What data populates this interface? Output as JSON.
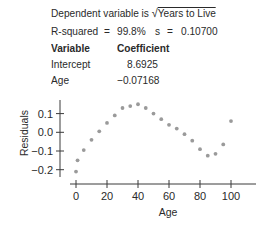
{
  "summary": {
    "dependent_prefix": "Dependent variable is",
    "dependent_radical": "√",
    "dependent_var": "Years to Live",
    "r_squared_label": "R-squared",
    "eq1": "=",
    "r_squared_value": "99.8%",
    "s_label": "s",
    "eq2": "=",
    "s_value": "0.10700"
  },
  "coef_table": {
    "headers": [
      "Variable",
      "Coefficient"
    ],
    "rows": [
      {
        "variable": "Intercept",
        "coefficient": "8.6925"
      },
      {
        "variable": "Age",
        "coefficient": "−0.07168"
      }
    ]
  },
  "chart_data": {
    "type": "scatter",
    "title": "",
    "xlabel": "Age",
    "ylabel": "Residuals",
    "xlim": [
      -3,
      118
    ],
    "ylim": [
      -0.26,
      0.18
    ],
    "xticks": [
      0,
      20,
      40,
      60,
      80,
      100
    ],
    "xtick_labels": [
      "0",
      "20",
      "40",
      "60",
      "80",
      "100"
    ],
    "yticks": [
      0.1,
      0.0,
      -0.1,
      -0.2
    ],
    "ytick_labels": [
      "0.1",
      "0.0",
      "−0.1",
      "−0.2"
    ],
    "grid": false,
    "legend": null,
    "point_color": "#9a9a9a",
    "series": [
      {
        "name": "Residuals",
        "x": [
          0,
          1,
          5,
          10,
          15,
          20,
          25,
          30,
          35,
          40,
          45,
          50,
          55,
          60,
          65,
          70,
          75,
          80,
          85,
          90,
          95,
          100
        ],
        "y": [
          -0.21,
          -0.15,
          -0.095,
          -0.04,
          0.005,
          0.05,
          0.09,
          0.13,
          0.14,
          0.15,
          0.13,
          0.1,
          0.07,
          0.04,
          0.02,
          -0.01,
          -0.045,
          -0.09,
          -0.125,
          -0.115,
          -0.065,
          0.06
        ]
      }
    ]
  }
}
